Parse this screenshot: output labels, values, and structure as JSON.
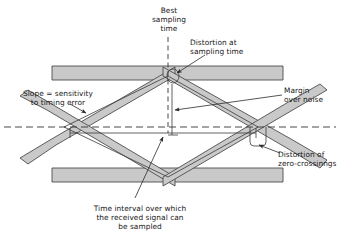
{
  "figure": {
    "type": "diagram",
    "background_color": "#ffffff",
    "line_color": "#333333",
    "band_fill_color": "#c9c9c9",
    "band_edge_color": "#4d4d4d",
    "dash_color": "#333333"
  },
  "labels": {
    "best_sampling_time": "Best\nsampling\ntime",
    "distortion_at_sampling_time": "Distortion at\nsampling time",
    "slope_sensitivity": "Slope = sensitivity\nto timing error",
    "margin_over_noise": "Margin\nover noise",
    "distortion_zero_crossings": "Distortion of\nzero-crossinngs",
    "time_interval": "Time interval over which\nthe received signal can\nbe sampled"
  },
  "geometry": {
    "top_bar": {
      "x": 52,
      "y": 66,
      "width": 231,
      "height": 14
    },
    "bottom_bar": {
      "x": 52,
      "y": 168,
      "width": 231,
      "height": 14
    },
    "center_line_y": 127,
    "left_crossing_x": 64,
    "right_crossing_x": 258,
    "apex_x": 168,
    "apex_top_y": 70,
    "apex_bottom_y": 180,
    "band_thickness": 9
  }
}
